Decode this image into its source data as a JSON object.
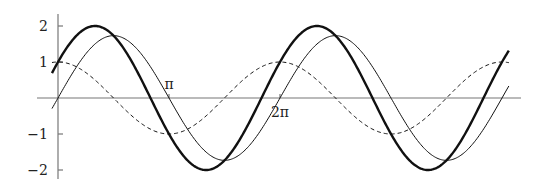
{
  "chart_data": {
    "type": "line",
    "title": "",
    "xlabel": "",
    "ylabel": "",
    "x_range": [
      -0.17,
      12.76
    ],
    "ylim": [
      -2,
      2
    ],
    "grid": false,
    "legend": null,
    "y_ticks": [
      {
        "value": 2,
        "label": "2"
      },
      {
        "value": 1,
        "label": "1"
      },
      {
        "value": -1,
        "label": "−1"
      },
      {
        "value": -2,
        "label": "−2"
      }
    ],
    "x_ticks": [
      {
        "value": 3.14159,
        "label": "π",
        "label_pos": "above"
      },
      {
        "value": 6.28318,
        "label": "2π",
        "label_pos": "below"
      }
    ],
    "series": [
      {
        "name": "cos(x)",
        "style": "dashed",
        "width": 1,
        "formula": "cos(x)",
        "amplitude": 1,
        "phase": 1.5708
      },
      {
        "name": "sqrt(3)·sin(x)",
        "style": "solid",
        "width": 1,
        "formula": "1.732*sin(x)",
        "amplitude": 1.732,
        "phase": 0
      },
      {
        "name": "sqrt(3)·sin(x)+cos(x)",
        "style": "solid",
        "width": 2.4,
        "formula": "2*sin(x+pi/6)",
        "amplitude": 2,
        "phase": 0.5236
      }
    ],
    "sample_points": {
      "x": [
        0,
        0.5236,
        1.0472,
        1.5708,
        2.0944,
        2.618,
        3.1416,
        4.1888,
        4.7124,
        5.236,
        6.2832
      ],
      "cos": [
        1,
        0.866,
        0.5,
        0,
        -0.5,
        -0.866,
        -1,
        -0.5,
        0,
        0.5,
        1
      ],
      "sqrt3_sin": [
        0,
        0.866,
        1.5,
        1.732,
        1.5,
        0.866,
        0,
        -1.5,
        -1.732,
        -1.5,
        0
      ],
      "sum": [
        1,
        1.732,
        2,
        1.732,
        1,
        0,
        -1,
        -2,
        -1.732,
        -1,
        1
      ]
    }
  },
  "colors": {
    "axis": "#777777",
    "curve": "#111111",
    "text": "#222222"
  }
}
